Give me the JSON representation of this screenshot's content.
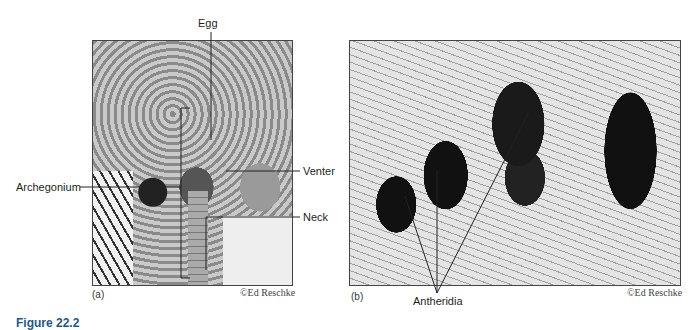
{
  "figure": {
    "caption_label": "Figure 22.2",
    "panels": [
      {
        "letter": "(a)",
        "credit": "©Ed Reschke",
        "labels": [
          "Egg",
          "Archegonium",
          "Venter",
          "Neck"
        ]
      },
      {
        "letter": "(b)",
        "credit": "©Ed Reschke",
        "labels": [
          "Antheridia"
        ]
      }
    ]
  }
}
